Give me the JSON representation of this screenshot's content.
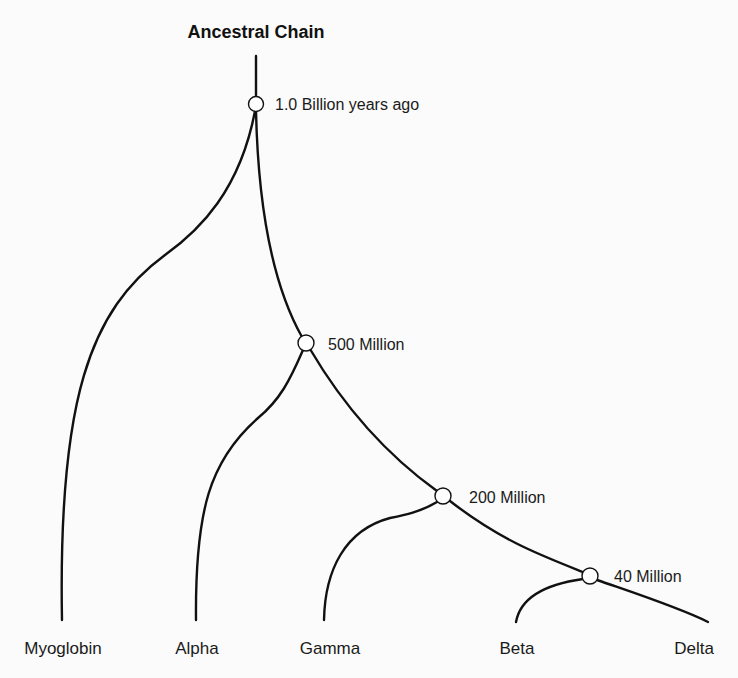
{
  "diagram": {
    "title": "Ancestral Chain",
    "type": "phylogenetic-tree",
    "nodes": [
      {
        "id": "n1",
        "label": "1.0 Billion years ago"
      },
      {
        "id": "n2",
        "label": "500 Million"
      },
      {
        "id": "n3",
        "label": "200 Million"
      },
      {
        "id": "n4",
        "label": "40 Million"
      }
    ],
    "leaves": [
      {
        "id": "myoglobin",
        "label": "Myoglobin",
        "parent": "n1"
      },
      {
        "id": "alpha",
        "label": "Alpha",
        "parent": "n2"
      },
      {
        "id": "gamma",
        "label": "Gamma",
        "parent": "n3"
      },
      {
        "id": "beta",
        "label": "Beta",
        "parent": "n4"
      },
      {
        "id": "delta",
        "label": "Delta",
        "parent": "n4"
      }
    ],
    "edges": [
      {
        "from": "root",
        "to": "n1"
      },
      {
        "from": "n1",
        "to": "myoglobin"
      },
      {
        "from": "n1",
        "to": "n2"
      },
      {
        "from": "n2",
        "to": "alpha"
      },
      {
        "from": "n2",
        "to": "n3"
      },
      {
        "from": "n3",
        "to": "gamma"
      },
      {
        "from": "n3",
        "to": "n4"
      },
      {
        "from": "n4",
        "to": "beta"
      },
      {
        "from": "n4",
        "to": "delta"
      }
    ]
  }
}
